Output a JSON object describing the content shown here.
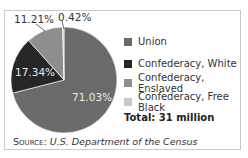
{
  "chart_data": {
    "type": "pie",
    "title": "",
    "categories": [
      "Union",
      "Confederacy, White",
      "Confederacy, Enslaved",
      "Confederacy, Free Black"
    ],
    "values": [
      71.03,
      17.34,
      11.21,
      0.42
    ],
    "value_labels": [
      "71.03%",
      "17.34%",
      "11.21%",
      "0.42%"
    ],
    "colors": [
      "#6b6b6b",
      "#262626",
      "#8e8e8e",
      "#c8c8c8"
    ],
    "legend_position": "right",
    "total_label": "Total: 31 million",
    "source_prefix": "Source:",
    "source_text": "U.S. Department of the Census"
  }
}
